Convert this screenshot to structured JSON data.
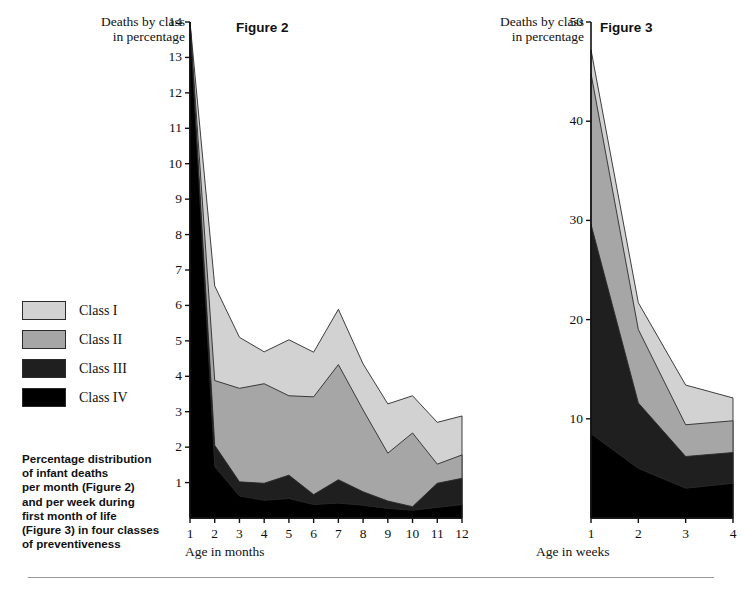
{
  "legend": {
    "items": [
      {
        "label": "Class I",
        "color": "#d2d2d2"
      },
      {
        "label": "Class II",
        "color": "#a6a6a6"
      },
      {
        "label": "Class III",
        "color": "#1f1f1f"
      },
      {
        "label": "Class IV",
        "color": "#000000"
      }
    ]
  },
  "caption": {
    "text": "Percentage distribution\nof infant deaths\nper month (Figure 2)\nand per week during\nfirst month of life\n(Figure 3) in four classes\nof preventiveness"
  },
  "figure2": {
    "title": "Figure 2",
    "y_axis_title": "Deaths by class\nin percentage",
    "x_axis_title": "Age in months"
  },
  "figure3": {
    "title": "Figure 3",
    "y_axis_title": "Deaths by class\nin percentage",
    "x_axis_title": "Age in weeks"
  },
  "chart_data": [
    {
      "type": "area",
      "id": "figure2",
      "title": "Figure 2",
      "stacked": true,
      "xlabel": "Age in months",
      "ylabel": "Deaths by class in percentage",
      "categories": [
        1,
        2,
        3,
        4,
        5,
        6,
        7,
        8,
        9,
        10,
        11,
        12
      ],
      "xlim": [
        1,
        12
      ],
      "ylim": [
        0,
        14
      ],
      "yticks": [
        1,
        2,
        3,
        4,
        5,
        6,
        7,
        8,
        9,
        10,
        11,
        12,
        13,
        14
      ],
      "xticks": [
        1,
        2,
        3,
        4,
        5,
        6,
        7,
        8,
        9,
        10,
        11,
        12
      ],
      "grid": false,
      "legend_position": "left-outside",
      "note": "Values at month 1 are clipped by the 14% axis maximum",
      "series": [
        {
          "name": "Class IV",
          "color": "#000000",
          "values": [
            14.0,
            1.45,
            0.62,
            0.5,
            0.55,
            0.38,
            0.42,
            0.36,
            0.27,
            0.22,
            0.3,
            0.38
          ]
        },
        {
          "name": "Class III",
          "color": "#1f1f1f",
          "values": [
            14.0,
            2.05,
            1.02,
            0.98,
            1.21,
            0.66,
            1.08,
            0.74,
            0.48,
            0.32,
            0.98,
            1.12
          ]
        },
        {
          "name": "Class II",
          "color": "#a6a6a6",
          "values": [
            14.0,
            3.88,
            3.66,
            3.79,
            3.45,
            3.42,
            4.33,
            3.05,
            1.83,
            2.4,
            1.52,
            1.78
          ]
        },
        {
          "name": "Class I",
          "color": "#d2d2d2",
          "values": [
            14.0,
            6.55,
            5.1,
            4.69,
            5.03,
            4.68,
            5.89,
            4.35,
            3.22,
            3.45,
            2.7,
            2.88
          ]
        }
      ],
      "cumulative_tops": {
        "class_iv": [
          14.0,
          1.45,
          0.62,
          0.5,
          0.55,
          0.38,
          0.42,
          0.36,
          0.27,
          0.22,
          0.3,
          0.38
        ],
        "class_iii": [
          14.0,
          2.05,
          1.02,
          0.98,
          1.21,
          0.66,
          1.08,
          0.74,
          0.48,
          0.32,
          0.98,
          1.12
        ],
        "class_ii": [
          14.0,
          3.88,
          3.66,
          3.79,
          3.45,
          3.42,
          4.33,
          3.05,
          1.83,
          2.4,
          1.52,
          1.78
        ],
        "class_i": [
          14.0,
          6.55,
          5.1,
          4.69,
          5.03,
          4.68,
          5.89,
          4.35,
          3.22,
          3.45,
          2.7,
          2.88
        ]
      }
    },
    {
      "type": "area",
      "id": "figure3",
      "title": "Figure 3",
      "stacked": true,
      "xlabel": "Age in weeks",
      "ylabel": "Deaths by class in percentage",
      "categories": [
        1,
        2,
        3,
        4
      ],
      "xlim": [
        1,
        4
      ],
      "ylim": [
        0,
        50
      ],
      "yticks": [
        10,
        20,
        30,
        40,
        50
      ],
      "xticks": [
        1,
        2,
        3,
        4
      ],
      "grid": false,
      "legend_position": "left-outside",
      "series": [
        {
          "name": "Class IV",
          "color": "#000000",
          "values": [
            8.5,
            5.0,
            3.0,
            3.5
          ]
        },
        {
          "name": "Class III",
          "color": "#1f1f1f",
          "values": [
            29.6,
            11.6,
            6.2,
            6.6
          ]
        },
        {
          "name": "Class II",
          "color": "#a6a6a6",
          "values": [
            44.8,
            19.0,
            9.4,
            9.8
          ]
        },
        {
          "name": "Class I",
          "color": "#d2d2d2",
          "values": [
            47.2,
            21.7,
            13.4,
            12.1
          ]
        }
      ],
      "cumulative_tops": {
        "class_iv": [
          8.5,
          5.0,
          3.0,
          3.5
        ],
        "class_iii": [
          29.6,
          11.6,
          6.2,
          6.6
        ],
        "class_ii": [
          44.8,
          19.0,
          9.4,
          9.8
        ],
        "class_i": [
          47.2,
          21.7,
          13.4,
          12.1
        ]
      }
    }
  ]
}
